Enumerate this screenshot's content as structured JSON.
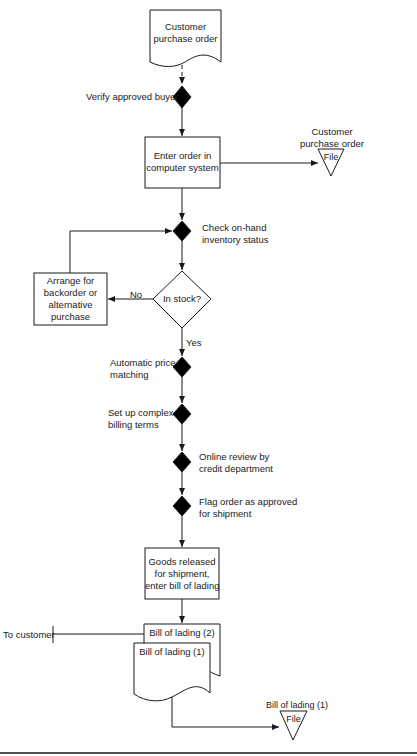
{
  "diagram": {
    "type": "flowchart",
    "colors": {
      "line": "#1a1a1a",
      "fill_decision": "#000000",
      "background": "#ffffff"
    },
    "nodes": {
      "customer_po_doc": {
        "line1": "Customer",
        "line2": "purchase order",
        "shape": "document"
      },
      "verify_buyer": {
        "label": "Verify approved buyer",
        "shape": "control-point"
      },
      "enter_order": {
        "line1": "Enter order in",
        "line2": "computer system",
        "shape": "process"
      },
      "po_file": {
        "line1": "Customer",
        "line2": "purchase order",
        "glyph": "File",
        "shape": "file-triangle"
      },
      "check_inventory": {
        "line1": "Check on-hand",
        "line2": "inventory status",
        "shape": "control-point"
      },
      "in_stock": {
        "label": "In stock?",
        "shape": "decision"
      },
      "arrange_backorder": {
        "line1": "Arrange for",
        "line2": "backorder or",
        "line3": "alternative",
        "line4": "purchase",
        "shape": "process"
      },
      "price_matching": {
        "line1": "Automatic price",
        "line2": "matching",
        "shape": "control-point"
      },
      "billing_terms": {
        "line1": "Set up complex",
        "line2": "billing terms",
        "shape": "control-point"
      },
      "credit_review": {
        "line1": "Online review by",
        "line2": "credit department",
        "shape": "control-point"
      },
      "flag_order": {
        "line1": "Flag order as approved",
        "line2": "for shipment",
        "shape": "control-point"
      },
      "goods_released": {
        "line1": "Goods released",
        "line2": "for shipment,",
        "line3": "enter bill of lading",
        "shape": "process"
      },
      "bol_2": {
        "label": "Bill of lading (2)",
        "shape": "document"
      },
      "bol_1": {
        "label": "Bill of lading (1)",
        "shape": "document"
      },
      "to_customer": {
        "label": "To customer",
        "shape": "terminator-bar"
      },
      "bol_file": {
        "label": "Bill of lading  (1)",
        "glyph": "File",
        "shape": "file-triangle"
      }
    },
    "edge_labels": {
      "no": "No",
      "yes": "Yes"
    }
  }
}
